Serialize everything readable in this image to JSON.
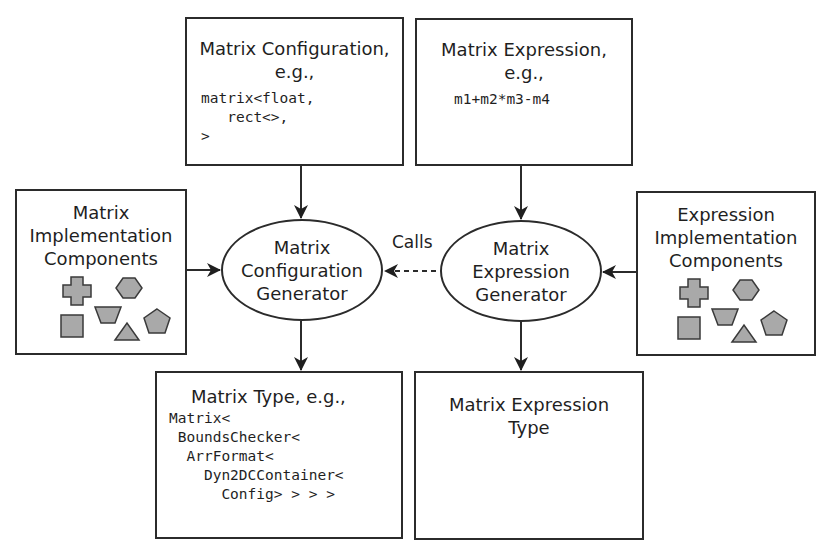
{
  "diagram": {
    "top_left_box": {
      "title_line1": "Matrix Configuration,",
      "title_line2": "e.g.,",
      "code": [
        "matrix<float,",
        "   rect<>,",
        ">"
      ]
    },
    "top_right_box": {
      "title_line1": "Matrix Expression,",
      "title_line2": "e.g.,",
      "code": [
        "m1+m2*m3-m4"
      ]
    },
    "left_box": {
      "lines": [
        "Matrix",
        "Implementation",
        "Components"
      ],
      "shapes": [
        "cross",
        "hexagon",
        "trapezoid",
        "square",
        "triangle",
        "pentagon"
      ]
    },
    "right_box": {
      "lines": [
        "Expression",
        "Implementation",
        "Components"
      ],
      "shapes": [
        "cross",
        "hexagon",
        "trapezoid",
        "square",
        "triangle",
        "pentagon"
      ]
    },
    "config_generator": {
      "lines": [
        "Matrix",
        "Configuration",
        "Generator"
      ]
    },
    "expression_generator": {
      "lines": [
        "Matrix",
        "Expression",
        "Generator"
      ]
    },
    "calls_label": "Calls",
    "bottom_left_box": {
      "title": "Matrix Type, e.g.,",
      "code": [
        "Matrix<",
        " BoundsChecker<",
        "  ArrFormat<",
        "    Dyn2DCContainer<",
        "      Config> > > >"
      ]
    },
    "bottom_right_box": {
      "lines": [
        "Matrix Expression",
        "Type"
      ]
    },
    "colors": {
      "line": "#2b2b2b",
      "shape_fill": "#a9a9a9",
      "shape_stroke": "#3a3a3a"
    }
  }
}
